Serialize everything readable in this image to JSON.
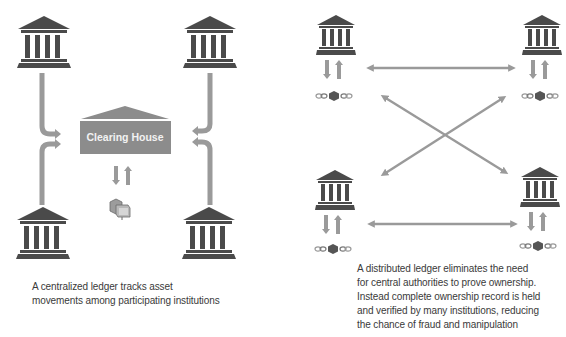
{
  "colors": {
    "bank": "#4a4a4a",
    "arrow": "#9a9a9a",
    "clearing_house": "#8c8c8c",
    "clearing_house_text": "#f2f2f2",
    "caption_text": "#3a3a3a",
    "block": "#555555"
  },
  "left_panel": {
    "title": "Centralized ledger",
    "clearing_house_label": "Clearing House",
    "nodes": [
      "bank-top-left",
      "bank-top-right",
      "bank-bottom-left",
      "bank-bottom-right"
    ],
    "asset_icon": "asset-box-icon",
    "caption_lines": [
      "A centralized ledger tracks asset",
      "movements among participating institutions"
    ]
  },
  "right_panel": {
    "title": "Distributed ledger",
    "nodes": [
      "bank-top-left",
      "bank-top-right",
      "bank-bottom-left",
      "bank-bottom-right"
    ],
    "node_icon": "bank-icon",
    "ledger_icon": "chain-block-icon",
    "connections": [
      "top-left<->top-right",
      "bottom-left<->bottom-right",
      "top-left<->bottom-right",
      "bottom-left<->top-right"
    ],
    "caption_lines": [
      "A distributed ledger eliminates the need",
      "for central authorities to prove ownership.",
      "Instead complete ownership record is held",
      "and verified by many institutions, reducing",
      "the chance of fraud and manipulation"
    ]
  }
}
